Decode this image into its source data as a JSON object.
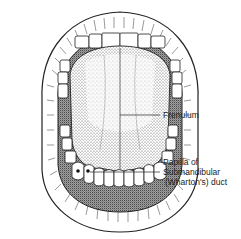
{
  "figure": {
    "labels": [
      {
        "id": "frenulum",
        "text": "Frenulum"
      },
      {
        "id": "papilla",
        "lines": [
          "Papilla of",
          "Submandibular",
          "(Wharton's) duct"
        ]
      }
    ]
  }
}
